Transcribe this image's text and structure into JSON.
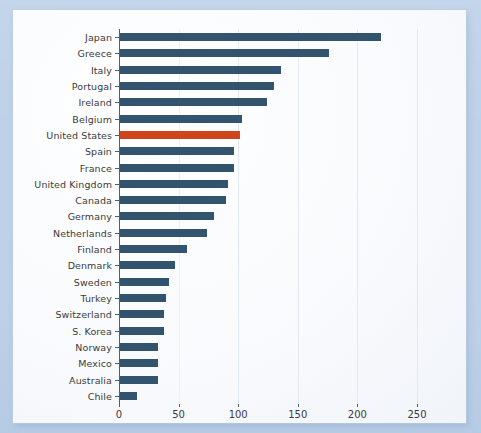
{
  "chart_data": {
    "type": "bar",
    "orientation": "horizontal",
    "title": "",
    "subtitle": "",
    "xlabel": "",
    "ylabel": "",
    "xlim": [
      0,
      250
    ],
    "xticks": [
      0,
      50,
      100,
      150,
      200,
      250
    ],
    "xtick_labels": [
      "0",
      "50",
      "100",
      "150",
      "200",
      "250"
    ],
    "grid": "vertical-faint",
    "legend": "none",
    "categories": [
      "Japan",
      "Greece",
      "Italy",
      "Portugal",
      "Ireland",
      "Belgium",
      "United States",
      "Spain",
      "France",
      "United Kingdom",
      "Canada",
      "Germany",
      "Netherlands",
      "Finland",
      "Denmark",
      "Sweden",
      "Turkey",
      "Switzerland",
      "S. Korea",
      "Norway",
      "Mexico",
      "Australia",
      "Chile"
    ],
    "values": [
      219,
      175,
      135,
      129,
      123,
      102,
      101,
      96,
      96,
      91,
      89,
      79,
      73,
      56,
      46,
      41,
      39,
      37,
      37,
      32,
      32,
      32,
      14
    ],
    "highlight_category": "United States",
    "colors": {
      "bar": "#33546e",
      "highlight": "#cf441a",
      "axis": "#46617c",
      "grid": "#e3e9f1",
      "text": "#3b3b3b",
      "panel_background": "#fdfdfe",
      "page_background": "#bdd1e8"
    }
  }
}
